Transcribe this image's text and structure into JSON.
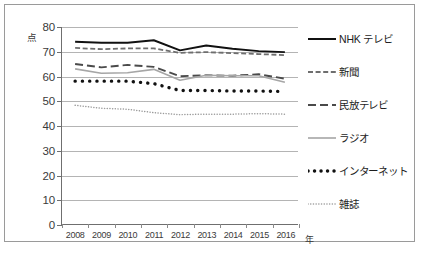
{
  "chart_data": {
    "type": "line",
    "title": "",
    "xlabel": "年",
    "ylabel": "点",
    "ylim": [
      0,
      80
    ],
    "ytick_values": [
      0,
      10,
      20,
      30,
      40,
      50,
      60,
      70,
      80
    ],
    "ytick_labels": [
      "0",
      "10",
      "20",
      "30",
      "40",
      "50",
      "60",
      "70",
      "80"
    ],
    "grid": true,
    "legend_position": "right",
    "categories": [
      "2008",
      "2009",
      "2010",
      "2011",
      "2012",
      "2013",
      "2014",
      "2015",
      "2016"
    ],
    "series": [
      {
        "name": "NHK テレビ",
        "style": "solid",
        "color": "#111111",
        "values": [
          74.0,
          73.6,
          73.6,
          74.6,
          70.5,
          72.5,
          71.2,
          70.2,
          69.8
        ]
      },
      {
        "name": "新聞",
        "style": "dashed-short",
        "color": "#6e6e6e",
        "values": [
          71.5,
          71.0,
          71.3,
          71.3,
          69.5,
          69.8,
          69.4,
          69.0,
          68.6
        ]
      },
      {
        "name": "民放テレビ",
        "style": "dashed-long",
        "color": "#4a4a4a",
        "values": [
          65.0,
          63.6,
          64.6,
          63.8,
          60.0,
          60.4,
          60.2,
          60.8,
          59.0
        ]
      },
      {
        "name": "ラジオ",
        "style": "solid-gray",
        "color": "#a6a6a6",
        "values": [
          63.0,
          61.2,
          61.4,
          62.8,
          58.4,
          60.4,
          60.2,
          60.2,
          57.6
        ]
      },
      {
        "name": "インターネット",
        "style": "dotted-bold",
        "color": "#111111",
        "values": [
          58.0,
          58.0,
          58.0,
          57.0,
          54.2,
          54.2,
          54.0,
          54.0,
          53.8
        ]
      },
      {
        "name": "雑誌",
        "style": "dotted-fine",
        "color": "#9b9b9b",
        "values": [
          48.2,
          47.0,
          46.6,
          45.2,
          44.4,
          44.6,
          44.6,
          44.8,
          44.6
        ]
      }
    ]
  },
  "axis": {
    "y_unit": "点",
    "x_unit": "年"
  },
  "caption": {
    "text": ""
  }
}
